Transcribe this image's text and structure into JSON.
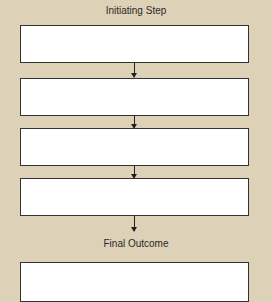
{
  "diagram": {
    "title": "Initiating Step",
    "steps": [
      "",
      "",
      "",
      ""
    ],
    "outcome_label": "Final Outcome",
    "outcome_box": "",
    "colors": {
      "background": "#ddd2b8",
      "box": "#ffffff",
      "border": "#333333"
    }
  }
}
